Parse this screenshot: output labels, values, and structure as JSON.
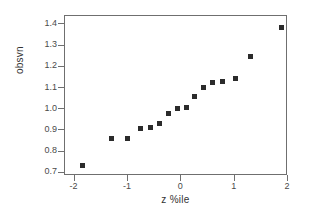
{
  "chart_data": {
    "type": "scatter",
    "title": "",
    "xlabel": "z %ile",
    "ylabel": "obsvn",
    "xlim": [
      -2.18,
      2.0
    ],
    "ylim": [
      0.685,
      1.44
    ],
    "grid": false,
    "legend": null,
    "marker": {
      "shape": "square",
      "color": "#2b2b2b",
      "size_px": 5
    },
    "axis": {
      "color": "#6f6f6f",
      "frame": "box"
    },
    "xticks": [
      -2,
      -1,
      0,
      1,
      2
    ],
    "xticklabels": [
      "-2",
      "-1",
      "0",
      "1",
      "2"
    ],
    "yticks": [
      0.7,
      0.8,
      0.9,
      1.0,
      1.1,
      1.2,
      1.3,
      1.4
    ],
    "yticklabels": [
      "0.7",
      "0.8",
      "0.9",
      "1.0",
      "1.1",
      "1.2",
      "1.3",
      "1.4"
    ],
    "points": [
      {
        "x": -1.85,
        "y": 0.735
      },
      {
        "x": -1.3,
        "y": 0.862
      },
      {
        "x": -1.0,
        "y": 0.861
      },
      {
        "x": -0.76,
        "y": 0.908
      },
      {
        "x": -0.58,
        "y": 0.912
      },
      {
        "x": -0.4,
        "y": 0.932
      },
      {
        "x": -0.24,
        "y": 0.978
      },
      {
        "x": -0.08,
        "y": 1.004
      },
      {
        "x": 0.09,
        "y": 1.007
      },
      {
        "x": 0.25,
        "y": 1.062
      },
      {
        "x": 0.41,
        "y": 1.102
      },
      {
        "x": 0.59,
        "y": 1.127
      },
      {
        "x": 0.78,
        "y": 1.132
      },
      {
        "x": 1.02,
        "y": 1.147
      },
      {
        "x": 1.3,
        "y": 1.247
      },
      {
        "x": 1.88,
        "y": 1.385
      }
    ]
  }
}
